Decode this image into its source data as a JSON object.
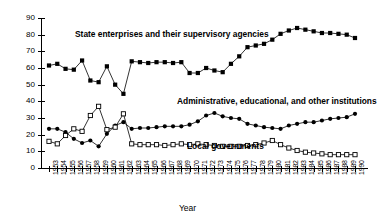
{
  "chart_data": {
    "type": "line",
    "title": "",
    "xlabel": "Year",
    "ylabel": "Per cent",
    "ylim": [
      0,
      90
    ],
    "ytick_labels": [
      "0",
      "10",
      "20",
      "30",
      "40",
      "50",
      "60",
      "70",
      "80",
      "90"
    ],
    "yticks": [
      0,
      10,
      20,
      30,
      40,
      50,
      60,
      70,
      80,
      90
    ],
    "grid": false,
    "legend_position": "inline-annotations",
    "x": [
      1953,
      1954,
      1955,
      1956,
      1957,
      1958,
      1959,
      1960,
      1961,
      1962,
      1963,
      1964,
      1965,
      1966,
      1967,
      1968,
      1969,
      1970,
      1971,
      1972,
      1973,
      1974,
      1975,
      1976,
      1977,
      1978,
      1979,
      1980,
      1981,
      1982,
      1983,
      1984,
      1985,
      1986,
      1987,
      1988,
      1989,
      1990
    ],
    "xtick_labels": [
      "1953",
      "1954",
      "1955",
      "1956",
      "1957",
      "1958",
      "1959",
      "1960",
      "1961",
      "1962",
      "1963",
      "1964",
      "1965",
      "1966",
      "1967",
      "1968",
      "1969",
      "1970",
      "1971",
      "1972",
      "1973",
      "1974",
      "1975",
      "1976",
      "1977",
      "1978",
      "1979",
      "1980",
      "1981",
      "1982",
      "1983",
      "1984",
      "1985",
      "1986",
      "1987",
      "1988",
      "1989",
      "1990"
    ],
    "series": [
      {
        "name": "State enterprises and their supervisory agencies",
        "marker": "filled-square",
        "color": "#000000",
        "values": [
          61.5,
          62.5,
          59.5,
          59.0,
          64.5,
          52.5,
          51.5,
          61.0,
          50.0,
          44.5,
          64.0,
          63.5,
          63.0,
          63.5,
          63.5,
          63.0,
          63.5,
          57.0,
          57.0,
          60.0,
          58.5,
          57.5,
          62.5,
          67.0,
          72.5,
          73.5,
          74.5,
          77.0,
          80.5,
          82.5,
          84.0,
          83.0,
          82.0,
          81.0,
          81.0,
          80.5,
          80.0,
          78.0
        ]
      },
      {
        "name": "Administrative, educational, and other institutions",
        "marker": "filled-circle",
        "color": "#000000",
        "values": [
          23.5,
          23.5,
          21.5,
          17.5,
          15.0,
          16.5,
          13.0,
          20.5,
          25.5,
          27.5,
          23.5,
          24.0,
          24.0,
          24.5,
          25.0,
          25.0,
          25.0,
          26.0,
          28.0,
          31.5,
          33.0,
          31.0,
          30.0,
          29.5,
          26.5,
          25.5,
          24.5,
          24.0,
          23.5,
          25.5,
          26.5,
          27.5,
          27.5,
          28.5,
          29.5,
          30.0,
          30.5,
          32.5
        ]
      },
      {
        "name": "Local governments",
        "marker": "open-square",
        "color": "#000000",
        "values": [
          16.0,
          14.5,
          19.5,
          23.5,
          22.0,
          31.5,
          37.0,
          23.0,
          24.5,
          32.5,
          14.5,
          14.0,
          14.0,
          14.0,
          13.5,
          14.0,
          14.5,
          14.0,
          14.5,
          14.0,
          13.5,
          13.0,
          13.0,
          13.0,
          13.5,
          14.0,
          15.0,
          16.5,
          14.0,
          12.0,
          10.5,
          9.5,
          9.0,
          8.5,
          8.0,
          8.0,
          8.0,
          8.0
        ]
      }
    ],
    "annotations": [
      {
        "name": "state-enterprises-label",
        "text": "State enterprises and their supervisory agencies"
      },
      {
        "name": "administrative-label",
        "text": "Administrative, educational, and other institutions"
      },
      {
        "name": "local-governments-label",
        "text": "Local governments"
      }
    ]
  }
}
